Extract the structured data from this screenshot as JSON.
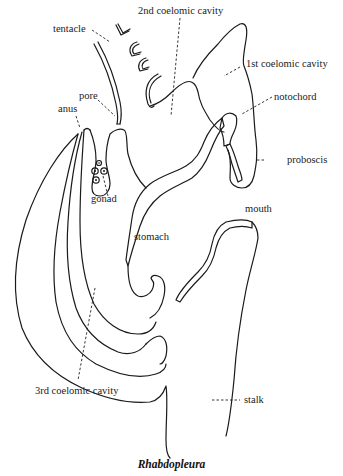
{
  "figure": {
    "caption": "Rhabdopleura",
    "labels": {
      "coelom2": "2nd coelomic cavity",
      "tentacle": "tentacle",
      "coelom1": "1st coelomic cavity",
      "pore": "pore",
      "anus": "anus",
      "notochord": "notochord",
      "gonad": "gonad",
      "proboscis": "proboscis",
      "mouth": "mouth",
      "stomach": "stomach",
      "coelom3": "3rd coelomic cavity",
      "stalk": "stalk"
    }
  }
}
